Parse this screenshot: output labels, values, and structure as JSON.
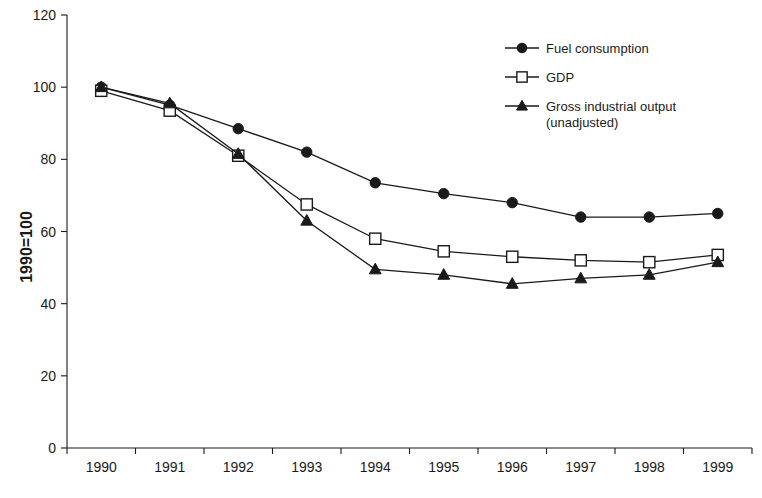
{
  "chart_data": {
    "type": "line",
    "title": "",
    "xlabel": "",
    "ylabel": "1990=100",
    "categories": [
      "1990",
      "1991",
      "1992",
      "1993",
      "1994",
      "1995",
      "1996",
      "1997",
      "1998",
      "1999"
    ],
    "x": [
      1990,
      1991,
      1992,
      1993,
      1994,
      1995,
      1996,
      1997,
      1998,
      1999
    ],
    "ylim": [
      0,
      120
    ],
    "yticks": [
      0,
      20,
      40,
      60,
      80,
      100,
      120
    ],
    "ytick_labels": [
      "0",
      "20",
      "40",
      "60",
      "80",
      "100",
      "120"
    ],
    "grid": false,
    "legend_position": "top-right",
    "series": [
      {
        "name": "Fuel consumption",
        "marker": "filled-circle",
        "values": [
          100,
          95,
          88.5,
          82,
          73.5,
          70.5,
          68,
          64,
          64,
          65
        ]
      },
      {
        "name": "GDP",
        "marker": "open-square",
        "values": [
          99,
          93.5,
          81,
          67.5,
          58,
          54.5,
          53,
          52,
          51.5,
          53.5
        ]
      },
      {
        "name": "Gross industrial output (unadjusted)",
        "marker": "filled-triangle",
        "values": [
          100,
          95.5,
          81.5,
          63,
          49.5,
          48,
          45.5,
          47,
          48,
          51.5
        ]
      }
    ]
  },
  "legend": {
    "entries": [
      {
        "label": "Fuel consumption",
        "marker": "filled-circle"
      },
      {
        "label": "GDP",
        "marker": "open-square"
      },
      {
        "label": "Gross industrial output",
        "label_line2": "(unadjusted)",
        "marker": "filled-triangle"
      }
    ]
  },
  "colors": {
    "ink": "#1a1a1a",
    "background": "#ffffff",
    "marker_fill_open": "#ffffff"
  }
}
